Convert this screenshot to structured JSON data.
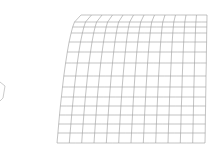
{
  "canvas": {
    "width": 211,
    "height": 163,
    "background": "#ffffff"
  },
  "mesh": {
    "color": "#9a9a9a",
    "columns": 12,
    "rows": 14,
    "corners": {
      "top_left": [
        81,
        15
      ],
      "top_right": [
        207,
        15
      ],
      "bottom_left": [
        57,
        143
      ],
      "bottom_right": [
        205,
        143
      ]
    },
    "row_y_right": [
      15,
      22,
      27,
      33,
      42,
      52,
      63,
      76,
      87,
      97,
      106,
      115,
      124,
      133,
      143
    ],
    "left_edge_bulge": -8
  },
  "partial_shape": {
    "name": "hexagon-outline-partial",
    "points": [
      [
        0,
        82
      ],
      [
        5,
        86
      ],
      [
        3,
        98
      ],
      [
        0,
        101
      ]
    ]
  }
}
